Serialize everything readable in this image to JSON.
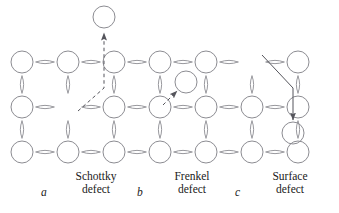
{
  "figure": {
    "background_color": "#ffffff",
    "lattice_stroke": "#8c8c92",
    "defect_stroke": "#55555c",
    "text_color": "#1a1a1a",
    "width": 339,
    "height": 213
  },
  "lattice": {
    "description": "Three rows of ionic lattice sites drawn as circles joined by horizontal and vertical lens-shaped bonds",
    "row_y": [
      62,
      107,
      152
    ],
    "col_x": [
      22,
      68,
      114,
      160,
      206,
      252,
      298
    ],
    "circle_radius": 11,
    "rows": [
      {
        "name": "top-row",
        "sites": [
          "atom",
          "atom",
          "atom",
          "atom",
          "atom",
          "vacancy",
          "atom"
        ]
      },
      {
        "name": "middle-row",
        "sites": [
          "atom",
          "vacancy",
          "atom",
          "atom",
          "atom",
          "atom",
          "atom"
        ]
      },
      {
        "name": "bottom-row",
        "sites": [
          "atom",
          "atom",
          "atom",
          "atom",
          "atom",
          "atom",
          "atom"
        ]
      }
    ]
  },
  "defects": [
    {
      "id": "schottky",
      "kind": "schottky-defect",
      "panel_letter": "a",
      "label_line1": "Schottky",
      "label_line2": "defect",
      "arrow_style": "dashed",
      "escaped_atom": {
        "cx": 104,
        "cy": 17,
        "r": 11
      },
      "vacancy_site": {
        "row": 1,
        "col": 1
      }
    },
    {
      "id": "frenkel",
      "kind": "frenkel-defect",
      "panel_letter": "b",
      "label_line1": "Frenkel",
      "label_line2": "defect",
      "arrow_style": "dashed",
      "interstitial_atom": {
        "cx": 186,
        "cy": 82,
        "r": 11
      }
    },
    {
      "id": "surface",
      "kind": "surface-defect",
      "panel_letter": "c",
      "label_line1": "Surface",
      "label_line2": "defect",
      "arrow_style": "solid",
      "displaced_atom": {
        "cx": 293,
        "cy": 133,
        "r": 11
      },
      "vacancy_site": {
        "row": 0,
        "col": 5
      }
    }
  ],
  "captions": {
    "letters": [
      {
        "text": "a",
        "x": 44,
        "y": 193
      },
      {
        "text": "b",
        "x": 140,
        "y": 193
      },
      {
        "text": "c",
        "x": 238,
        "y": 193
      }
    ],
    "blocks": [
      {
        "x": 62,
        "y": 172,
        "width": 70,
        "line1": "Schottky",
        "line2": "defect"
      },
      {
        "x": 158,
        "y": 172,
        "width": 70,
        "line1": "Frenkel",
        "line2": "defect"
      },
      {
        "x": 256,
        "y": 172,
        "width": 70,
        "line1": "Surface",
        "line2": "defect"
      }
    ]
  }
}
